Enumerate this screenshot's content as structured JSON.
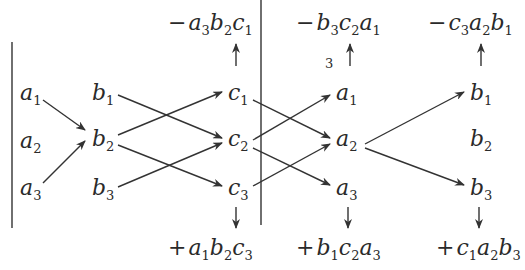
{
  "diagram": {
    "nodes": {
      "col1": [
        {
          "v": "a",
          "s": "1"
        },
        {
          "v": "a",
          "s": "2"
        },
        {
          "v": "a",
          "s": "3"
        }
      ],
      "col2": [
        {
          "v": "b",
          "s": "1"
        },
        {
          "v": "b",
          "s": "2"
        },
        {
          "v": "b",
          "s": "3"
        }
      ],
      "col3": [
        {
          "v": "c",
          "s": "1"
        },
        {
          "v": "c",
          "s": "2"
        },
        {
          "v": "c",
          "s": "3"
        }
      ],
      "col4": [
        {
          "v": "a",
          "s": "1"
        },
        {
          "v": "a",
          "s": "2"
        },
        {
          "v": "a",
          "s": "3"
        }
      ],
      "col5": [
        {
          "v": "b",
          "s": "1"
        },
        {
          "v": "b",
          "s": "2"
        },
        {
          "v": "b",
          "s": "3"
        }
      ]
    },
    "top_terms": [
      {
        "sign": "−",
        "f": [
          {
            "v": "a",
            "s": "3"
          },
          {
            "v": "b",
            "s": "2"
          },
          {
            "v": "c",
            "s": "1"
          }
        ]
      },
      {
        "sign": "−",
        "f": [
          {
            "v": "b",
            "s": "3"
          },
          {
            "v": "c",
            "s": "2"
          },
          {
            "v": "a",
            "s": "1"
          }
        ]
      },
      {
        "sign": "−",
        "f": [
          {
            "v": "c",
            "s": "3"
          },
          {
            "v": "a",
            "s": "2"
          },
          {
            "v": "b",
            "s": "1"
          }
        ]
      }
    ],
    "bottom_terms": [
      {
        "sign": "+",
        "f": [
          {
            "v": "a",
            "s": "1"
          },
          {
            "v": "b",
            "s": "2"
          },
          {
            "v": "c",
            "s": "3"
          }
        ]
      },
      {
        "sign": "+",
        "f": [
          {
            "v": "b",
            "s": "1"
          },
          {
            "v": "c",
            "s": "2"
          },
          {
            "v": "a",
            "s": "3"
          }
        ]
      },
      {
        "sign": "+",
        "f": [
          {
            "v": "c",
            "s": "1"
          },
          {
            "v": "a",
            "s": "2"
          },
          {
            "v": "b",
            "s": "3"
          }
        ]
      }
    ],
    "stray_mark": "3",
    "edges": [
      [
        "a1",
        "b2"
      ],
      [
        "a3",
        "b2"
      ],
      [
        "b1",
        "c2"
      ],
      [
        "b2",
        "c1"
      ],
      [
        "b2",
        "c3"
      ],
      [
        "b3",
        "c2"
      ],
      [
        "c1",
        "a2"
      ],
      [
        "c2",
        "a1"
      ],
      [
        "c2",
        "a3"
      ],
      [
        "c3",
        "a2"
      ],
      [
        "a2",
        "b1"
      ],
      [
        "a2",
        "b3"
      ]
    ]
  }
}
